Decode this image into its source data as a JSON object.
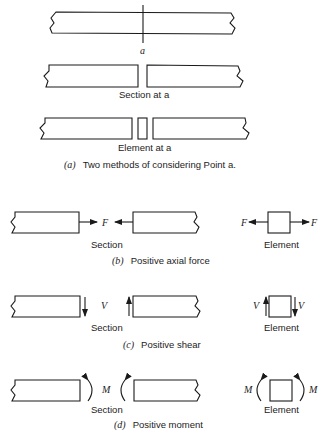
{
  "panel_a": {
    "cut_label": "a",
    "section_label": "Section at a",
    "element_label": "Element at a",
    "caption_letter": "(a)",
    "caption_text": "Two methods of considering Point a."
  },
  "panel_b": {
    "force_symbol": "F",
    "section_label": "Section",
    "element_label": "Element",
    "caption_letter": "(b)",
    "caption_text": "Positive axial force"
  },
  "panel_c": {
    "force_symbol": "V",
    "section_label": "Section",
    "element_label": "Element",
    "caption_letter": "(c)",
    "caption_text": "Positive shear"
  },
  "panel_d": {
    "force_symbol": "M",
    "section_label": "Section",
    "element_label": "Element",
    "caption_letter": "(d)",
    "caption_text": "Positive moment"
  }
}
